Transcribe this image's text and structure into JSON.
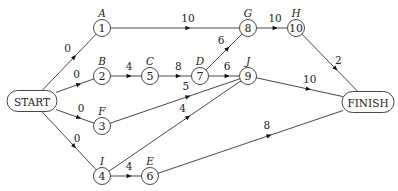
{
  "diagram": {
    "title": "",
    "terminals": [
      {
        "id": "START",
        "label": "START",
        "x": 32,
        "y": 101,
        "w": 50,
        "h": 21
      },
      {
        "id": "FINISH",
        "label": "FINISH",
        "x": 368,
        "y": 102,
        "w": 52,
        "h": 21
      }
    ],
    "nodes": [
      {
        "id": "1",
        "number": "1",
        "activity": "A",
        "x": 102,
        "y": 28
      },
      {
        "id": "2",
        "number": "2",
        "activity": "B",
        "x": 102,
        "y": 76
      },
      {
        "id": "3",
        "number": "3",
        "activity": "F",
        "x": 102,
        "y": 126
      },
      {
        "id": "4",
        "number": "4",
        "activity": "I",
        "x": 102,
        "y": 176
      },
      {
        "id": "5",
        "number": "5",
        "activity": "C",
        "x": 150,
        "y": 76
      },
      {
        "id": "6",
        "number": "6",
        "activity": "E",
        "x": 150,
        "y": 176
      },
      {
        "id": "7",
        "number": "7",
        "activity": "D",
        "x": 200,
        "y": 76
      },
      {
        "id": "8",
        "number": "8",
        "activity": "G",
        "x": 248,
        "y": 28
      },
      {
        "id": "9",
        "number": "9",
        "activity": "J",
        "x": 248,
        "y": 76
      },
      {
        "id": "10",
        "number": "10",
        "activity": "H",
        "x": 296,
        "y": 28
      }
    ],
    "edges": [
      {
        "from": "START",
        "to": "1",
        "weight": "0"
      },
      {
        "from": "START",
        "to": "2",
        "weight": "0"
      },
      {
        "from": "START",
        "to": "3",
        "weight": "0"
      },
      {
        "from": "START",
        "to": "4",
        "weight": "0"
      },
      {
        "from": "1",
        "to": "8",
        "weight": "10"
      },
      {
        "from": "2",
        "to": "5",
        "weight": "4"
      },
      {
        "from": "5",
        "to": "7",
        "weight": "8"
      },
      {
        "from": "7",
        "to": "8",
        "weight": "6"
      },
      {
        "from": "7",
        "to": "9",
        "weight": "6"
      },
      {
        "from": "3",
        "to": "9",
        "weight": "5"
      },
      {
        "from": "4",
        "to": "9",
        "weight": "4"
      },
      {
        "from": "4",
        "to": "6",
        "weight": "4"
      },
      {
        "from": "8",
        "to": "10",
        "weight": "10"
      },
      {
        "from": "10",
        "to": "FINISH",
        "weight": "2"
      },
      {
        "from": "9",
        "to": "FINISH",
        "weight": "10"
      },
      {
        "from": "6",
        "to": "FINISH",
        "weight": "8"
      }
    ]
  },
  "colors": {
    "line": "#333333",
    "arrow": "#111111",
    "text": "#222222",
    "background": "#ffffff"
  }
}
